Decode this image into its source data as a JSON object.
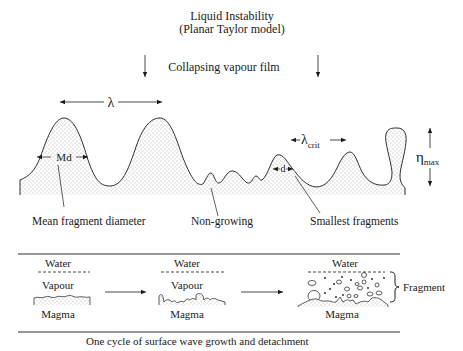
{
  "title": {
    "line1": "Liquid Instability",
    "line2": "(Planar Taylor model)"
  },
  "top_panel": {
    "collapsing_label": "Collapsing vapour film",
    "wavelength_symbol": "λ",
    "critical_wavelength_symbol": "λ",
    "critical_wavelength_subscript": "crit",
    "md_label": "Md",
    "d_label": "d",
    "eta_symbol": "η",
    "eta_subscript": "max",
    "callouts": {
      "mean_fragment": "Mean fragment diameter",
      "non_growing": "Non-growing",
      "smallest_fragments": "Smallest fragments"
    }
  },
  "bottom_panel": {
    "stages": [
      {
        "water": "Water",
        "vapour": "Vapour",
        "magma": "Magma"
      },
      {
        "water": "Water",
        "vapour": "Vapour",
        "magma": "Magma"
      },
      {
        "water": "Water",
        "magma": "Magma"
      }
    ],
    "fragment_label": "Fragment",
    "caption": "One cycle of surface wave growth and detachment"
  },
  "colors": {
    "ink": "#1a1a1a",
    "stipple": "#555555",
    "background": "#ffffff"
  }
}
